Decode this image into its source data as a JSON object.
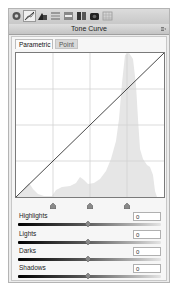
{
  "toolbar": {
    "icons": [
      {
        "name": "basic-settings-icon"
      },
      {
        "name": "tone-curve-icon"
      },
      {
        "name": "hsl-icon"
      },
      {
        "name": "split-toning-icon"
      },
      {
        "name": "detail-icon"
      },
      {
        "name": "lens-corrections-icon"
      },
      {
        "name": "camera-calibration-icon"
      },
      {
        "name": "presets-icon"
      }
    ],
    "active_index": 1
  },
  "panel": {
    "title": "Tone Curve",
    "menu_icon": "panel-menu-icon"
  },
  "tabs": [
    {
      "label": "Parametric",
      "active": true
    },
    {
      "label": "Point",
      "active": false
    }
  ],
  "graph": {
    "grid_divisions": 4,
    "curve": "linear-diagonal",
    "histogram_color": "#e6e6e6",
    "grid_color": "#d0d0d0",
    "split_handles": [
      25,
      50,
      75
    ]
  },
  "sliders": [
    {
      "label": "Highlights",
      "value": "0",
      "position": 50
    },
    {
      "label": "Lights",
      "value": "0",
      "position": 50
    },
    {
      "label": "Darks",
      "value": "0",
      "position": 50
    },
    {
      "label": "Shadows",
      "value": "0",
      "position": 50
    }
  ]
}
